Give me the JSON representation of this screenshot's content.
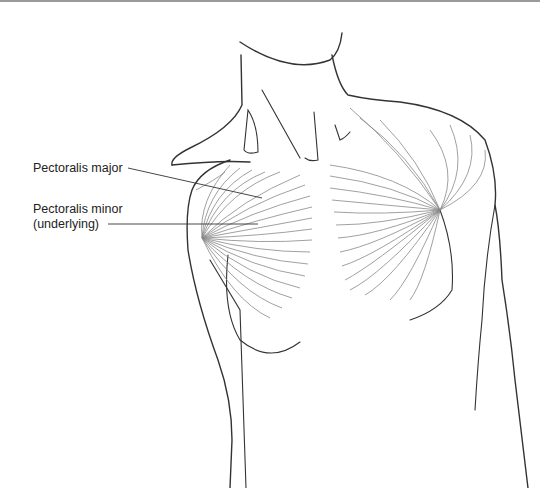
{
  "figure": {
    "labels": [
      {
        "id": "pect-major",
        "text": "Pectoralis major"
      },
      {
        "id": "pect-minor",
        "line1": "Pectoralis minor",
        "line2": "(underlying)"
      }
    ],
    "colors": {
      "outline": "#333333",
      "fibers": "#888888",
      "label_text": "#222222",
      "rule": "#9a9a9a"
    }
  }
}
